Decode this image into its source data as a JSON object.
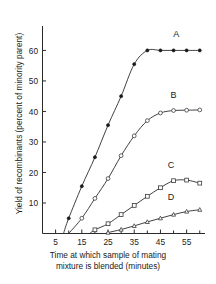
{
  "chart_data": {
    "type": "line",
    "title": "",
    "xlabel": "Time at which sample of mating mixture is blended (minutes)",
    "xlabel_line1": "Time at which sample of mating",
    "xlabel_line2": "mixture is blended (minutes)",
    "ylabel": "Yield of recombinants (percent of minority parent)",
    "xlim": [
      0,
      62
    ],
    "ylim": [
      0,
      68
    ],
    "xticks": [
      5,
      15,
      25,
      35,
      45,
      55
    ],
    "xtick_labels": [
      "5",
      "15",
      "25",
      "35",
      "45",
      "55"
    ],
    "xminor_ticks": [
      10,
      20,
      30,
      40,
      50,
      60
    ],
    "yticks": [
      10,
      20,
      30,
      40,
      50,
      60
    ],
    "ytick_labels": [
      "10",
      "20",
      "30",
      "40",
      "50",
      "60"
    ],
    "grid": false,
    "legend_position": "inline-right",
    "series": [
      {
        "name": "A",
        "label": "A",
        "marker": "filled-circle",
        "label_x": 51,
        "label_y": 64.5,
        "x": [
          8,
          10,
          15,
          20,
          25,
          30,
          35,
          40,
          45,
          50,
          55,
          60
        ],
        "y": [
          0,
          5,
          15.5,
          25,
          35.5,
          45,
          55.5,
          60,
          60,
          60,
          60,
          60
        ]
      },
      {
        "name": "B",
        "label": "B",
        "marker": "open-circle",
        "label_x": 50,
        "label_y": 44.5,
        "x": [
          10,
          15,
          20,
          25,
          30,
          35,
          40,
          45,
          50,
          55,
          60
        ],
        "y": [
          0,
          5,
          11.5,
          18,
          25.5,
          32,
          37,
          39.5,
          40.3,
          40.4,
          40.5
        ]
      },
      {
        "name": "C",
        "label": "C",
        "marker": "open-square",
        "label_x": 49,
        "label_y": 21.5,
        "x": [
          18,
          20,
          25,
          30,
          35,
          40,
          45,
          50,
          55,
          60
        ],
        "y": [
          0,
          1.2,
          3.2,
          6.2,
          9.2,
          12.2,
          15,
          17.3,
          17.5,
          16.5
        ]
      },
      {
        "name": "D",
        "label": "D",
        "marker": "open-triangle",
        "label_x": 49,
        "label_y": 11.0,
        "x": [
          24,
          25,
          30,
          35,
          40,
          45,
          50,
          55,
          60
        ],
        "y": [
          0,
          0.3,
          1.3,
          2.5,
          3.8,
          5.0,
          6.2,
          7.2,
          7.8
        ]
      }
    ]
  }
}
